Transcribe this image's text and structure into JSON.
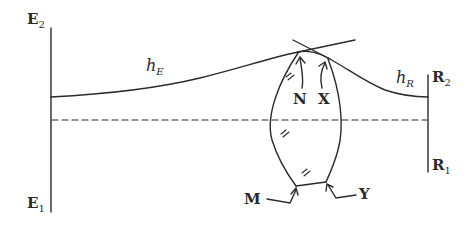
{
  "diagram": {
    "type": "geometric/optical schematic",
    "labels": {
      "E2": {
        "main": "E",
        "sub": "2"
      },
      "E1": {
        "main": "E",
        "sub": "1"
      },
      "R2": {
        "main": "R",
        "sub": "2"
      },
      "R1": {
        "main": "R",
        "sub": "1"
      },
      "hE": {
        "main": "h",
        "sub": "E"
      },
      "hR": {
        "main": "h",
        "sub": "R"
      },
      "N": "N",
      "X": "X",
      "M": "M",
      "Y": "Y"
    },
    "colors": {
      "stroke": "#2a2a2a",
      "background": "#ffffff"
    }
  }
}
